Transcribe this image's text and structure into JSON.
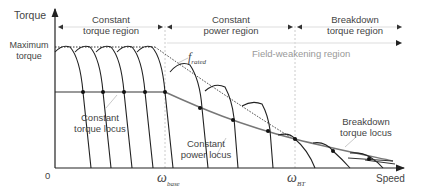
{
  "axes": {
    "y_label": "Torque",
    "x_label": "Speed",
    "origin": "0",
    "max_torque_label": "Maximum torque"
  },
  "regions": {
    "constant_torque": "Constant torque region",
    "constant_power": "Constant power region",
    "breakdown_torque": "Breakdown torque region",
    "field_weakening": "Field-weakening region"
  },
  "curve_labels": {
    "f_rated": "f",
    "f_rated_sub": "rated",
    "constant_torque_locus": "Constant torque locus",
    "constant_power_locus": "Constant power locus",
    "breakdown_torque_locus": "Breakdown torque locus"
  },
  "x_ticks": {
    "omega_base": "ω",
    "omega_base_sub": "base",
    "omega_bt": "ω",
    "omega_bt_sub": "BT"
  },
  "colors": {
    "axis": "#222222",
    "curve": "#222222",
    "locus": "#777777",
    "guide": "#cccccc"
  }
}
